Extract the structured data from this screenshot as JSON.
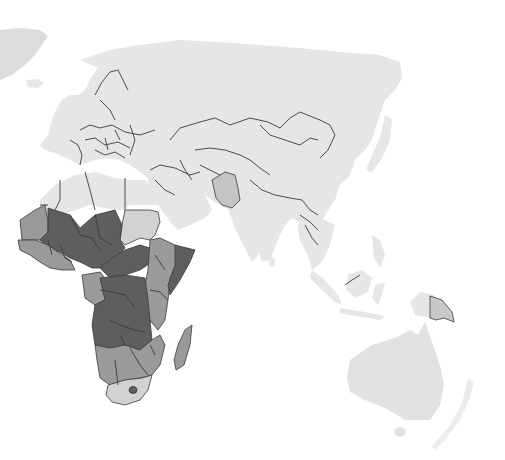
{
  "map": {
    "type": "choropleth",
    "projection": "orthographic-like, centered on Eurasia/Africa",
    "legend": null,
    "title": null,
    "colors": {
      "background": "#ffffff",
      "base_land": "#e6e6e6",
      "greenland": "#dcdcdc",
      "border": "#3a3a3a",
      "class_1_light": "#d2d2d2",
      "class_2_medium": "#9a9a9a",
      "class_3_dark": "#5e5e5e",
      "class_4_medium_light": "#b8b8b8"
    },
    "shaded_regions": [
      {
        "name": "North Africa (Morocco, Algeria, Libya, Egypt)",
        "class": "base"
      },
      {
        "name": "Sudan",
        "class": "light"
      },
      {
        "name": "Mauritania",
        "class": "medium"
      },
      {
        "name": "Mali, Niger, Chad, Nigeria",
        "class": "dark"
      },
      {
        "name": "West African coast",
        "class": "medium"
      },
      {
        "name": "South Sudan, CAR",
        "class": "dark"
      },
      {
        "name": "Ethiopia, Kenya, Tanzania",
        "class": "medium"
      },
      {
        "name": "Somalia",
        "class": "dark"
      },
      {
        "name": "DR Congo, Angola, Zambia",
        "class": "dark"
      },
      {
        "name": "Gabon, Congo",
        "class": "medium"
      },
      {
        "name": "Namibia, Botswana, Zimbabwe, Mozambique",
        "class": "medium"
      },
      {
        "name": "South Africa",
        "class": "light"
      },
      {
        "name": "Madagascar",
        "class": "medium"
      },
      {
        "name": "Afghanistan, Pakistan",
        "class": "medium_light"
      },
      {
        "name": "Papua New Guinea",
        "class": "medium_light"
      }
    ]
  }
}
